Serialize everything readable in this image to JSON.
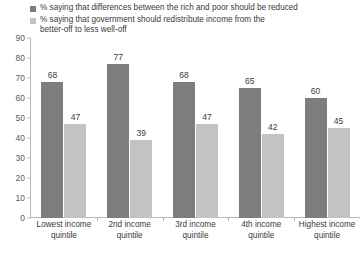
{
  "chart_data": {
    "type": "bar",
    "title": "",
    "xlabel": "",
    "ylabel": "",
    "ylim": [
      0,
      90
    ],
    "yticks": [
      0,
      10,
      20,
      30,
      40,
      50,
      60,
      70,
      80,
      90
    ],
    "grid": false,
    "legend_position": "top",
    "categories": [
      "Lowest income\nquintile",
      "2nd income\nquintile",
      "3rd income\nquintile",
      "4th income\nquintile",
      "Highest income\nquintile"
    ],
    "series": [
      {
        "name": "% saying that differences between the rich and poor should be reduced",
        "color": "#7d7d7d",
        "values": [
          68,
          77,
          68,
          65,
          60
        ]
      },
      {
        "name": "% saying that government should redistribute income from the\nbetter-off to less well-off",
        "color": "#c3c3c3",
        "values": [
          47,
          39,
          47,
          42,
          45
        ]
      }
    ]
  },
  "colors": {
    "series_dark": "#7d7d7d",
    "series_light": "#c3c3c3",
    "axis": "#b9b9b9",
    "text": "#3a3a3a",
    "tick_text": "#5a5a5a",
    "background": "#ffffff"
  }
}
